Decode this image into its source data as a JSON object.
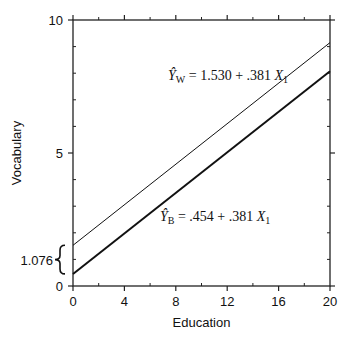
{
  "chart_data": {
    "type": "line",
    "title": "",
    "xlabel": "Education",
    "ylabel": "Vocabulary",
    "xlim": [
      0,
      20
    ],
    "ylim": [
      0,
      10
    ],
    "x_ticks": [
      0,
      4,
      8,
      12,
      16,
      20
    ],
    "x_minor_ticks": [
      2,
      6,
      10,
      14,
      18
    ],
    "y_ticks": [
      0,
      5,
      10
    ],
    "y_minor_ticks": [
      1,
      2,
      3,
      4,
      6,
      7,
      8,
      9
    ],
    "grid": false,
    "legend": "none",
    "series": [
      {
        "name": "W",
        "label_hat": "Ŷ",
        "label_sub": "W",
        "equation_rhs": "= 1.530 + .381",
        "var": "X",
        "var_sub": "1",
        "intercept": 1.53,
        "slope": 0.381,
        "x": [
          0,
          20
        ],
        "y": [
          1.53,
          9.15
        ],
        "stroke_width": 1
      },
      {
        "name": "B",
        "label_hat": "Ŷ",
        "label_sub": "B",
        "equation_rhs": "= .454 + .381",
        "var": "X",
        "var_sub": "1",
        "intercept": 0.454,
        "slope": 0.381,
        "x": [
          0,
          20
        ],
        "y": [
          0.454,
          8.074
        ],
        "stroke_width": 2
      }
    ],
    "annotations": [
      {
        "type": "brace",
        "text": "1.076",
        "from_y": 0.454,
        "to_y": 1.53,
        "x": 0
      }
    ]
  },
  "labels": {
    "xlabel": "Education",
    "ylabel": "Vocabulary",
    "brace_value": "1.076"
  }
}
